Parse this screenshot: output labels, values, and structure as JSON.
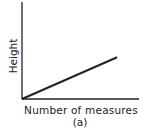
{
  "chart_data": {
    "type": "line",
    "title": "",
    "subtitle": "(a)",
    "xlabel": "Number of measures",
    "ylabel": "Height",
    "grid": false,
    "legend": null,
    "ticks": false,
    "series": [
      {
        "name": "Height",
        "x": [
          0,
          1
        ],
        "y": [
          0,
          0.43
        ]
      }
    ],
    "xlim": [
      0,
      1.23
    ],
    "ylim": [
      0,
      1
    ]
  },
  "labels": {
    "xlabel": "Number of measures",
    "ylabel": "Height",
    "panel": "(a)"
  },
  "colors": {
    "axis": "#222222",
    "line": "#222222"
  }
}
